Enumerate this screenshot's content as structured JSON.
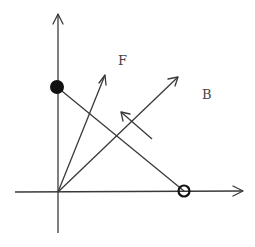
{
  "diagram": {
    "labels": {
      "F": "F",
      "B": "B"
    },
    "colors": {
      "line": "#3a3a3a",
      "point": "#111111",
      "background": "#ffffff"
    },
    "elements": {
      "vertical_axis": {
        "x": 58,
        "y_top": 14,
        "y_bottom": 233
      },
      "horizontal_axis": {
        "y": 192,
        "x_left": 15,
        "x_right": 243
      },
      "origin": {
        "x": 58,
        "y": 192
      },
      "vector_F": {
        "from": [
          58,
          192
        ],
        "to": [
          105,
          75
        ]
      },
      "vector_B": {
        "from": [
          58,
          192
        ],
        "to": [
          178,
          77
        ]
      },
      "segment_filled_to_open": {
        "from": [
          57,
          87
        ],
        "to": [
          184,
          191
        ]
      },
      "small_arrow": {
        "from": [
          152,
          139
        ],
        "to": [
          121,
          112
        ]
      },
      "filled_point": {
        "cx": 57,
        "cy": 87,
        "r": 7
      },
      "open_point": {
        "cx": 184,
        "cy": 191,
        "r": 5.5
      }
    }
  }
}
